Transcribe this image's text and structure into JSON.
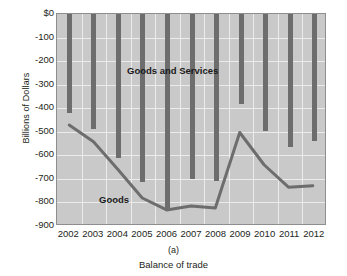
{
  "chart_data": {
    "type": "bar",
    "title": "",
    "subtitle": "",
    "panel_letter": "(a)",
    "caption": "Balance of trade",
    "xlabel": "",
    "ylabel": "Billions of Dollars",
    "categories": [
      "2002",
      "2003",
      "2004",
      "2005",
      "2006",
      "2007",
      "2008",
      "2009",
      "2010",
      "2011",
      "2012"
    ],
    "ylim": [
      -900,
      0
    ],
    "ytick_labels": [
      "$0",
      "-100",
      "-200",
      "-300",
      "-400",
      "-500",
      "-600",
      "-700",
      "-800",
      "-900"
    ],
    "ytick_values": [
      0,
      -100,
      -200,
      -300,
      -400,
      -500,
      -600,
      -700,
      -800,
      -900
    ],
    "grid": true,
    "legend_position": "inline-annotations",
    "series": [
      {
        "name": "Goods and Services",
        "render": "bar",
        "color": "#6d6d6d",
        "values": [
          -420,
          -490,
          -611,
          -714,
          -838,
          -700,
          -708,
          -384,
          -495,
          -563,
          -540
        ]
      },
      {
        "name": "Goods",
        "render": "line",
        "color": "#6d6d6d",
        "values": [
          -475,
          -547,
          -665,
          -787,
          -838,
          -821,
          -830,
          -507,
          -645,
          -741,
          -735
        ]
      }
    ],
    "annotations": [
      {
        "text": "Goods and Services",
        "series": "Goods and Services"
      },
      {
        "text": "Goods",
        "series": "Goods"
      }
    ],
    "colors": {
      "bar": "#6d6d6d",
      "line": "#6d6d6d",
      "plot_background": "#c9c9c9",
      "grid": "#ebebeb",
      "axis": "#8e8e8e",
      "text": "#231f20"
    }
  }
}
